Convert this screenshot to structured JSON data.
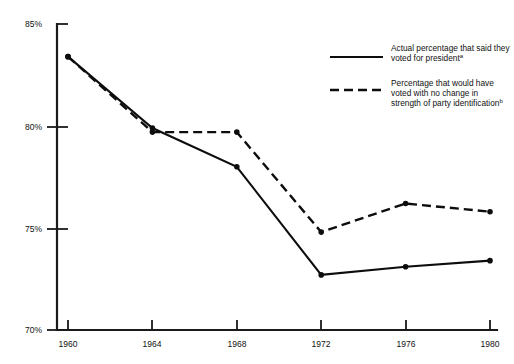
{
  "chart_data": {
    "type": "line",
    "title": "",
    "subtitle": "",
    "xlabel": "",
    "ylabel": "",
    "x": [
      1960,
      1964,
      1968,
      1972,
      1976,
      1980
    ],
    "xtick_labels": [
      "1960",
      "1964",
      "1968",
      "1972",
      "1976",
      "1980"
    ],
    "ytick_labels": [
      "85%",
      "80%",
      "75%",
      "70%"
    ],
    "ytick_values": [
      85,
      80,
      75,
      70
    ],
    "ylim": [
      70,
      85
    ],
    "xlim": [
      1960,
      1980
    ],
    "grid": false,
    "legend_position": "top-right",
    "series": [
      {
        "name": "Actual percentage that said they voted for president",
        "note_marker": "a",
        "style": "solid",
        "color": "#0d0d0d",
        "values": [
          83.4,
          79.9,
          78.0,
          72.7,
          73.1,
          73.4
        ]
      },
      {
        "name": "Percentage that would have voted with no change in strength of party identification",
        "note_marker": "b",
        "style": "dashed",
        "color": "#0d0d0d",
        "values": [
          83.4,
          79.7,
          79.7,
          74.8,
          76.2,
          75.8
        ]
      }
    ],
    "legend": [
      {
        "line1": "Actual percentage that said they",
        "line2": "voted for president",
        "line3": "",
        "sup": "a",
        "sup_line": 2,
        "style": "solid"
      },
      {
        "line1": "Percentage that would have",
        "line2": "voted with no change in",
        "line3": "strength of party identification",
        "sup": "b",
        "sup_line": 3,
        "style": "dashed"
      }
    ]
  }
}
